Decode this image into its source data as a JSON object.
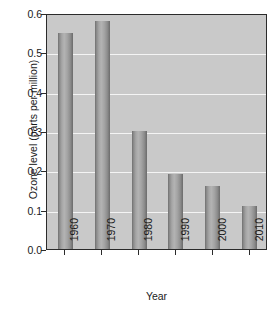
{
  "chart_data": {
    "type": "bar",
    "title": "",
    "subtitle": "",
    "xlabel": "Year",
    "ylabel": "Ozone level (parts per million)",
    "categories": [
      "1960",
      "1970",
      "1980",
      "1990",
      "2000",
      "2010"
    ],
    "values": [
      0.55,
      0.58,
      0.3,
      0.19,
      0.16,
      0.11
    ],
    "ylim": [
      0.0,
      0.6
    ],
    "ytick_labels": [
      "0.0",
      "0.1",
      "0.2",
      "0.3",
      "0.4",
      "0.5",
      "0.6"
    ],
    "ytick_values": [
      0.0,
      0.1,
      0.2,
      0.3,
      0.4,
      0.5,
      0.6
    ],
    "grid": "horizontal",
    "legend": "none",
    "annotations": [],
    "colors": {
      "plot_background": "#c9c9c9",
      "page_background": "#ffffff",
      "gridline": "#f4f4f4",
      "axis": "#2b2b2b",
      "bar_light": "#b3b3b3",
      "bar_dark": "#6b6b6b",
      "text": "#1a1a1a"
    }
  }
}
